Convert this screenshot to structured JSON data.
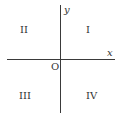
{
  "diagram": {
    "axes": {
      "x_label": "x",
      "y_label": "y",
      "origin_label": "O"
    },
    "quadrants": [
      {
        "id": "quadrant-1",
        "label": "I"
      },
      {
        "id": "quadrant-2",
        "label": "II"
      },
      {
        "id": "quadrant-3",
        "label": "III"
      },
      {
        "id": "quadrant-4",
        "label": "IV"
      }
    ],
    "colors": {
      "axis": "#3a3a3a",
      "text": "#333333",
      "background": "#ffffff"
    }
  }
}
